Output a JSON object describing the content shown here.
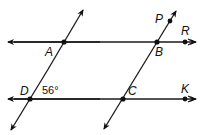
{
  "figure": {
    "type": "geometry",
    "points": [
      {
        "name": "A",
        "x": 64,
        "y": 42
      },
      {
        "name": "B",
        "x": 157,
        "y": 42
      },
      {
        "name": "C",
        "x": 123,
        "y": 99
      },
      {
        "name": "D",
        "x": 30,
        "y": 99
      },
      {
        "name": "P",
        "x": 170,
        "y": 21
      },
      {
        "name": "R",
        "x": 185,
        "y": 42
      },
      {
        "name": "K",
        "x": 185,
        "y": 99
      }
    ],
    "labels": {
      "A": "A",
      "B": "B",
      "C": "C",
      "D": "D",
      "P": "P",
      "R": "R",
      "K": "K"
    },
    "angle": {
      "vertex": "D",
      "value": "56°"
    },
    "lines": [
      {
        "name": "line-AB",
        "through": [
          "A",
          "B",
          "R"
        ]
      },
      {
        "name": "line-DC",
        "through": [
          "D",
          "C",
          "K"
        ]
      },
      {
        "name": "line-AD",
        "through": [
          "A",
          "D"
        ]
      },
      {
        "name": "line-BC",
        "through": [
          "P",
          "B",
          "C"
        ]
      }
    ]
  }
}
